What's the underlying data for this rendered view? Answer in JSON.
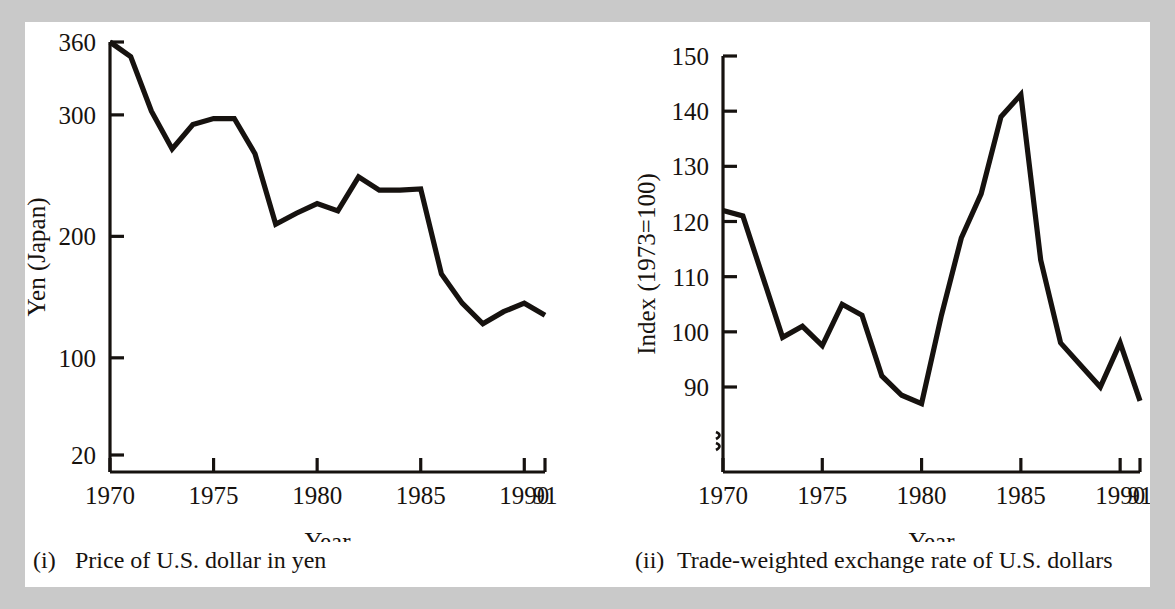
{
  "page": {
    "background_color": "#ffffff",
    "surround_color": "#c9c9c9",
    "ink_color": "#16120f"
  },
  "figures": [
    {
      "id": "left",
      "caption_number": "(i)",
      "caption_text": "Price of U.S. dollar in yen"
    },
    {
      "id": "right",
      "caption_number": "(ii)",
      "caption_text": "Trade-weighted exchange rate of U.S. dollars"
    }
  ],
  "chart_data": [
    {
      "type": "line",
      "title": "Price of U.S. dollar in yen",
      "xlabel": "Year",
      "ylabel": "Yen (Japan)",
      "xlim": [
        1970,
        1991
      ],
      "ylim": [
        20,
        360
      ],
      "grid": false,
      "legend": "none",
      "y_ticks": [
        20,
        100,
        200,
        300,
        360
      ],
      "y_tick_labels": [
        "20",
        "100",
        "200",
        "300",
        "360"
      ],
      "x_ticks": [
        1970,
        1975,
        1980,
        1985,
        1990,
        1991
      ],
      "x_tick_labels": [
        "1970",
        "1975",
        "1980",
        "1985",
        "1990",
        "91"
      ],
      "x": [
        1970,
        1971,
        1972,
        1973,
        1974,
        1975,
        1976,
        1977,
        1978,
        1979,
        1980,
        1981,
        1982,
        1983,
        1984,
        1985,
        1986,
        1987,
        1988,
        1989,
        1990,
        1991
      ],
      "values": [
        360,
        348,
        303,
        272,
        292,
        297,
        297,
        268,
        210,
        219,
        227,
        221,
        249,
        238,
        238,
        239,
        169,
        145,
        128,
        138,
        145,
        135
      ],
      "series": [
        {
          "name": "Price of U.S. dollar in yen",
          "values": [
            360,
            348,
            303,
            272,
            292,
            297,
            297,
            268,
            210,
            219,
            227,
            221,
            249,
            238,
            238,
            239,
            169,
            145,
            128,
            138,
            145,
            135
          ]
        }
      ]
    },
    {
      "type": "line",
      "title": "Trade-weighted exchange rate of U.S. dollars",
      "xlabel": "Year",
      "ylabel": "Index (1973=100)",
      "xlim": [
        1970,
        1991
      ],
      "ylim": [
        85,
        150
      ],
      "grid": false,
      "legend": "none",
      "axis_break": true,
      "y_ticks": [
        90,
        100,
        110,
        120,
        130,
        140,
        150
      ],
      "y_tick_labels": [
        "90",
        "100",
        "110",
        "120",
        "130",
        "140",
        "150"
      ],
      "x_ticks": [
        1970,
        1975,
        1980,
        1985,
        1990,
        1991
      ],
      "x_tick_labels": [
        "1970",
        "1975",
        "1980",
        "1985",
        "1990",
        "91"
      ],
      "x": [
        1970,
        1971,
        1972,
        1973,
        1974,
        1975,
        1976,
        1977,
        1978,
        1979,
        1980,
        1981,
        1982,
        1983,
        1984,
        1985,
        1986,
        1987,
        1988,
        1989,
        1990,
        1991
      ],
      "values": [
        122,
        121,
        110,
        99,
        101,
        97.5,
        105,
        103,
        92,
        88.5,
        87,
        103,
        117,
        125,
        139,
        143,
        113,
        98,
        94,
        90,
        98,
        87.5,
        90
      ],
      "series": [
        {
          "name": "Trade-weighted exchange rate index",
          "values": [
            122,
            121,
            110,
            99,
            101,
            97.5,
            105,
            103,
            92,
            88.5,
            87,
            103,
            117,
            125,
            139,
            143,
            113,
            98,
            94,
            90,
            98,
            87.5,
            90
          ]
        }
      ]
    }
  ]
}
